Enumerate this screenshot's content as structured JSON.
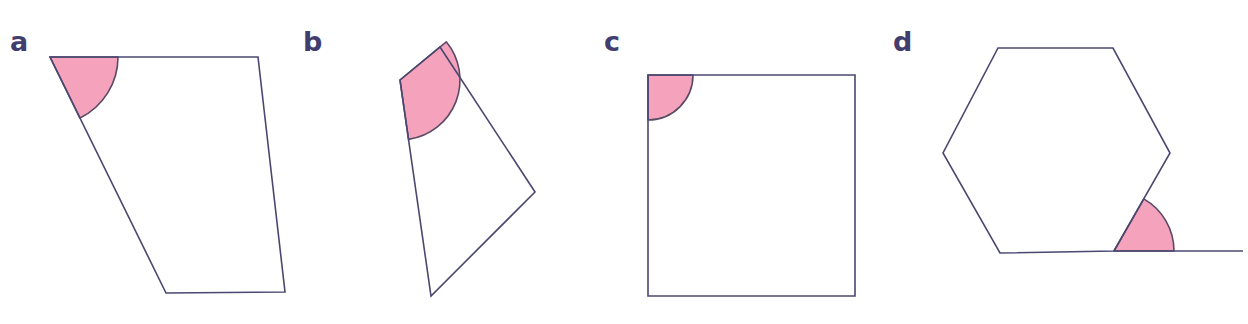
{
  "figure": {
    "background_color": "#ffffff",
    "stroke_color": "#4a4870",
    "angle_fill_color": "#f5a2bd",
    "angle_stroke_color": "#5a4a66",
    "label_color": "#413d6e",
    "accent_color": "#e8622a",
    "stroke_width": 1.6,
    "width": 1248,
    "height": 324
  },
  "cropped_heading": {
    "visible_fragment": "",
    "accent_fragment": ""
  },
  "panels": [
    {
      "id": "a",
      "label": "a",
      "shape_name": "quadrilateral",
      "vertices": [
        [
          50,
          57
        ],
        [
          258,
          57
        ],
        [
          285,
          292
        ],
        [
          166,
          293
        ]
      ],
      "marked_angle": {
        "vertex": [
          50,
          57
        ],
        "radius": 68,
        "start_deg": 0,
        "end_deg": 66,
        "arm_points": [
          [
            258,
            57
          ],
          [
            166,
            293
          ]
        ]
      }
    },
    {
      "id": "b",
      "label": "b",
      "shape_name": "quadrilateral",
      "vertices": [
        [
          400,
          80
        ],
        [
          440,
          47
        ],
        [
          535,
          192
        ],
        [
          431,
          296
        ]
      ],
      "marked_angle": {
        "vertex": [
          400,
          80
        ],
        "radius": 60,
        "start_deg": -39,
        "end_deg": 80,
        "arm_points": [
          [
            440,
            47
          ],
          [
            431,
            296
          ]
        ]
      }
    },
    {
      "id": "c",
      "label": "c",
      "shape_name": "square",
      "vertices": [
        [
          648,
          75
        ],
        [
          855,
          75
        ],
        [
          855,
          296
        ],
        [
          648,
          296
        ]
      ],
      "marked_angle": {
        "vertex": [
          648,
          75
        ],
        "radius": 45,
        "start_deg": 0,
        "end_deg": 90,
        "arm_points": [
          [
            855,
            75
          ],
          [
            648,
            296
          ]
        ]
      }
    },
    {
      "id": "d",
      "label": "d",
      "shape_name": "hexagon",
      "vertices": [
        [
          998,
          48
        ],
        [
          1113,
          48
        ],
        [
          1170,
          153
        ],
        [
          1114,
          251
        ],
        [
          1000,
          253
        ],
        [
          943,
          153
        ]
      ],
      "extended_ray": [
        [
          1114,
          251
        ],
        [
          1243,
          251
        ]
      ],
      "marked_angle": {
        "vertex": [
          1114,
          251
        ],
        "radius": 60,
        "start_deg": 0,
        "end_deg": 60,
        "arm_points": [
          [
            1243,
            251
          ],
          [
            1170,
            153
          ]
        ]
      }
    }
  ]
}
